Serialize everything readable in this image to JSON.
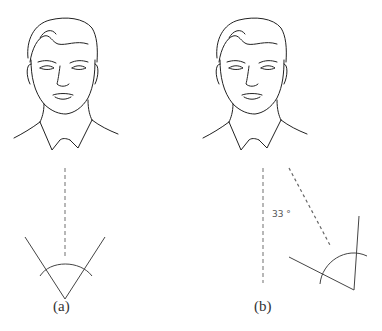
{
  "figure": {
    "panels": [
      {
        "label": "(a)",
        "description": "Face facing forward; dashed line straight down to symmetric V-shape with arc"
      },
      {
        "label": "(b)",
        "description": "Face facing forward; dashed vertical line and dashed line at angle to rotated V-shape with arc"
      }
    ],
    "angle_label": "33 °"
  }
}
